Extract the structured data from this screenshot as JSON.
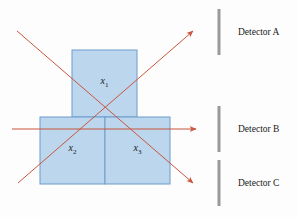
{
  "colors": {
    "background": "#fdfdfd",
    "box_fill": "#bcd6ee",
    "box_stroke": "#6a9ccc",
    "ray": "#c8553d",
    "detector": "#9a9a9a",
    "text": "#1a1a1a"
  },
  "boxes": [
    {
      "id": "x1",
      "label": "x",
      "sub": "1",
      "x": 72,
      "y": 50,
      "w": 65,
      "h": 67
    },
    {
      "id": "x2",
      "label": "x",
      "sub": "2",
      "x": 40,
      "y": 117,
      "w": 65,
      "h": 67
    },
    {
      "id": "x3",
      "label": "x",
      "sub": "3",
      "x": 105,
      "y": 117,
      "w": 65,
      "h": 67
    }
  ],
  "rays": [
    {
      "id": "ray-descending",
      "x1": 17,
      "y1": 31,
      "x2": 193,
      "y2": 183
    },
    {
      "id": "ray-ascending",
      "x1": 18,
      "y1": 183,
      "x2": 193,
      "y2": 31
    },
    {
      "id": "ray-horizontal",
      "x1": 12,
      "y1": 129,
      "x2": 196,
      "y2": 129
    }
  ],
  "detectors": [
    {
      "id": "A",
      "label": "Detector A",
      "y1": 9,
      "y2": 55,
      "label_y": 27
    },
    {
      "id": "B",
      "label": "Detector B",
      "y1": 106,
      "y2": 152,
      "label_y": 124
    },
    {
      "id": "C",
      "label": "Detector C",
      "y1": 160,
      "y2": 206,
      "label_y": 178
    }
  ]
}
